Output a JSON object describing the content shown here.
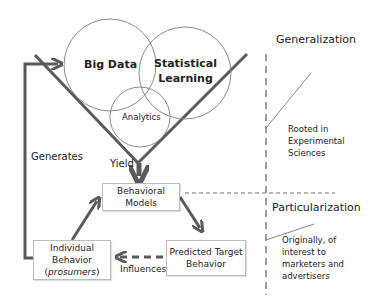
{
  "venn": {
    "big_data": "Big Data",
    "statistical_learning_line1": "Statistical",
    "statistical_learning_line2": "Learning",
    "analytics": "Analytics"
  },
  "edges": {
    "generates": "Generates",
    "yield": "Yield",
    "influences": "Influences"
  },
  "boxes": {
    "behavioral_models": [
      "Behavioral",
      "Models"
    ],
    "predicted_target_behavior": [
      "Predicted Target",
      "Behavior"
    ],
    "individual_behavior": [
      "Individual",
      "Behavior",
      "prosumers"
    ]
  },
  "right_panel": {
    "generalization": {
      "title": "Generalization",
      "note": [
        "Rooted in",
        "Experimental",
        "Sciences"
      ]
    },
    "particularization": {
      "title": "Particularization",
      "note": [
        "Originally, of",
        "interest to",
        "marketers and",
        "advertisers"
      ]
    }
  },
  "colors": {
    "arrow": "#5a5a5a",
    "dashed": "#a0a0a0",
    "circle": "#8a8a8a"
  }
}
